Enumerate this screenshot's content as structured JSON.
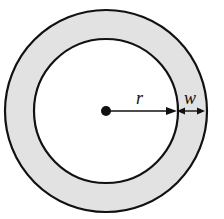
{
  "diagram": {
    "type": "annulus",
    "colors": {
      "background": "#ffffff",
      "ring_fill": "#e2e2e2",
      "stroke": "#111111"
    },
    "center": {
      "x": 106,
      "y": 111
    },
    "outer_radius": 101,
    "inner_radius": 72,
    "labels": {
      "radius": "r",
      "width": "w"
    }
  }
}
